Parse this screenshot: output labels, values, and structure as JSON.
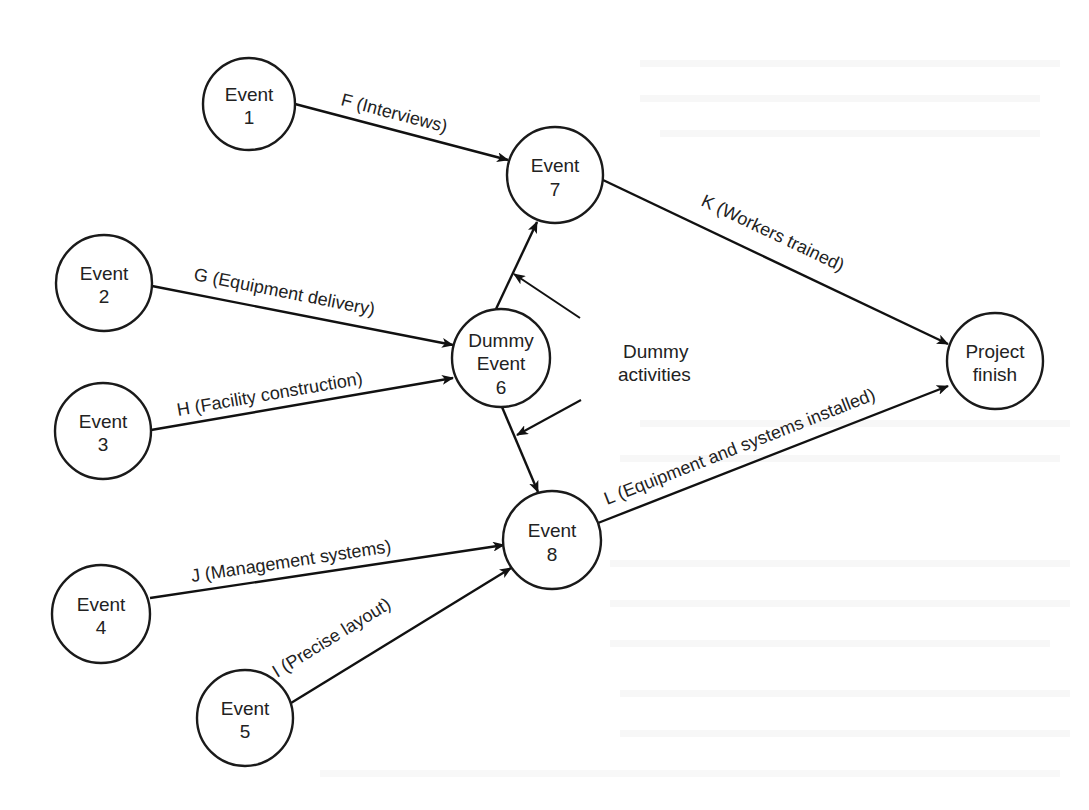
{
  "diagram": {
    "type": "PERT network (activity-on-arrow)",
    "nodes": {
      "e1": {
        "line1": "Event",
        "line2": "1"
      },
      "e2": {
        "line1": "Event",
        "line2": "2"
      },
      "e3": {
        "line1": "Event",
        "line2": "3"
      },
      "e4": {
        "line1": "Event",
        "line2": "4"
      },
      "e5": {
        "line1": "Event",
        "line2": "5"
      },
      "e6": {
        "line1": "Dummy",
        "line2": "Event",
        "line3": "6"
      },
      "e7": {
        "line1": "Event",
        "line2": "7"
      },
      "e8": {
        "line1": "Event",
        "line2": "8"
      },
      "finish": {
        "line1": "Project",
        "line2": "finish"
      }
    },
    "edges": {
      "F": {
        "from": "Event 1",
        "to": "Event 7",
        "label": "F (Interviews)"
      },
      "G": {
        "from": "Event 2",
        "to": "Dummy Event 6",
        "label": "G (Equipment delivery)"
      },
      "H": {
        "from": "Event 3",
        "to": "Dummy Event 6",
        "label": "H (Facility construction)"
      },
      "J": {
        "from": "Event 4",
        "to": "Event 8",
        "label": "J (Management systems)"
      },
      "I": {
        "from": "Event 5",
        "to": "Event 8",
        "label": "I (Precise layout)"
      },
      "K": {
        "from": "Event 7",
        "to": "Project finish",
        "label": "K (Workers trained)"
      },
      "L": {
        "from": "Event 8",
        "to": "Project finish",
        "label": "L (Equipment and systems installed)"
      },
      "D1": {
        "from": "Dummy Event 6",
        "to": "Event 7",
        "label": ""
      },
      "D2": {
        "from": "Dummy Event 6",
        "to": "Event 8",
        "label": ""
      }
    },
    "annotation": {
      "line1": "Dummy",
      "line2": "activities",
      "points_to": [
        "D1",
        "D2"
      ]
    }
  }
}
